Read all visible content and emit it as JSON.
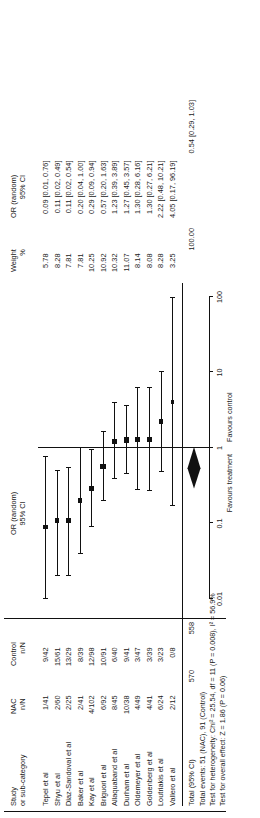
{
  "figure": {
    "type": "forest-plot",
    "columns": {
      "study_header_line1": "Study",
      "study_header_line2": "or sub-category",
      "nac_header_line1": "NAC",
      "nac_header_line2": "n/N",
      "control_header_line1": "Control",
      "control_header_line2": "n/N",
      "graph_header_line1": "OR (random)",
      "graph_header_line2": "95% CI",
      "weight_header_line1": "Weight",
      "weight_header_line2": "%",
      "or_header_line1": "OR (random)",
      "or_header_line2": "95% CI"
    },
    "axis": {
      "ticks": [
        "0.01",
        "0.1",
        "1",
        "10",
        "100"
      ],
      "left_label": "Favours treatment",
      "right_label": "Favours control"
    },
    "totals": {
      "label": "Total (95% CI)",
      "nac_total": "570",
      "control_total": "558",
      "weight": "100.00",
      "or_ci": "0.54 [0.29, 1.03]",
      "events_line": "Total events: 51 (NAC), 91 (Control)",
      "heterogeneity_line": "Test for heterogeneity: Chi² = 25.54, df = 11 (P = 0.008), I² = 56.9%",
      "overall_effect_line": "Test for overall effect: Z = 1.86 (P = 0.06)"
    }
  },
  "chart_data": {
    "type": "forest",
    "title": "",
    "xlabel": "",
    "ylabel": "",
    "xlim": [
      0.01,
      100
    ],
    "xscale": "log",
    "xticks": [
      0.01,
      0.1,
      1,
      10,
      100
    ],
    "grid": false,
    "legend": "none",
    "reference_line": 1,
    "annotations": [
      "Favours treatment",
      "Favours control"
    ],
    "studies": [
      {
        "name": "Tepel et al",
        "nac": "1/41",
        "control": "9/42",
        "weight": "5.78",
        "weight_value": 5.78,
        "or": 0.09,
        "ci_low": 0.01,
        "ci_high": 0.76,
        "or_ci": "0.09 [0.01, 0.76]"
      },
      {
        "name": "Shyu et al",
        "nac": "2/60",
        "control": "15/61",
        "weight": "8.28",
        "weight_value": 8.28,
        "or": 0.11,
        "ci_low": 0.02,
        "ci_high": 0.49,
        "or_ci": "0.11 [0.02, 0.49]"
      },
      {
        "name": "Diaz-Sandoval et al",
        "nac": "2/25",
        "control": "13/29",
        "weight": "7.81",
        "weight_value": 7.81,
        "or": 0.11,
        "ci_low": 0.02,
        "ci_high": 0.54,
        "or_ci": "0.11 [0.02, 0.54]"
      },
      {
        "name": "Baker et al",
        "nac": "2/41",
        "control": "8/39",
        "weight": "7.81",
        "weight_value": 7.81,
        "or": 0.2,
        "ci_low": 0.04,
        "ci_high": 1.0,
        "or_ci": "0.20 [0.04, 1.00]"
      },
      {
        "name": "Kay et al",
        "nac": "4/102",
        "control": "12/98",
        "weight": "10.25",
        "weight_value": 10.25,
        "or": 0.29,
        "ci_low": 0.09,
        "ci_high": 0.94,
        "or_ci": "0.29 [0.09, 0.94]"
      },
      {
        "name": "Briguori et al",
        "nac": "6/92",
        "control": "10/91",
        "weight": "10.92",
        "weight_value": 10.92,
        "or": 0.57,
        "ci_low": 0.2,
        "ci_high": 1.63,
        "or_ci": "0.57 [0.20, 1.63]"
      },
      {
        "name": "Allaquaband et al",
        "nac": "8/45",
        "control": "6/40",
        "weight": "10.32",
        "weight_value": 10.32,
        "or": 1.23,
        "ci_low": 0.39,
        "ci_high": 3.89,
        "or_ci": "1.23 [0.39, 3.89]"
      },
      {
        "name": "Durham et al",
        "nac": "10/38",
        "control": "9/41",
        "weight": "11.07",
        "weight_value": 11.07,
        "or": 1.27,
        "ci_low": 0.45,
        "ci_high": 3.57,
        "or_ci": "1.27 [0.45, 3.57]"
      },
      {
        "name": "Oldemeyer et al",
        "nac": "4/49",
        "control": "3/47",
        "weight": "8.14",
        "weight_value": 8.14,
        "or": 1.3,
        "ci_low": 0.28,
        "ci_high": 6.16,
        "or_ci": "1.30 [0.28, 6.16]"
      },
      {
        "name": "Goldenberg et al",
        "nac": "4/41",
        "control": "3/39",
        "weight": "8.08",
        "weight_value": 8.08,
        "or": 1.3,
        "ci_low": 0.27,
        "ci_high": 6.21,
        "or_ci": "1.30 [0.27, 6.21]"
      },
      {
        "name": "Loutriakis et al",
        "nac": "6/24",
        "control": "3/23",
        "weight": "8.28",
        "weight_value": 8.28,
        "or": 2.22,
        "ci_low": 0.48,
        "ci_high": 10.21,
        "or_ci": "2.22 [0.48, 10.21]"
      },
      {
        "name": "Vallero et al",
        "nac": "2/12",
        "control": "0/8",
        "weight": "3.25",
        "weight_value": 3.25,
        "or": 4.05,
        "ci_low": 0.17,
        "ci_high": 96.19,
        "or_ci": "4.05 [0.17, 96.19]"
      }
    ],
    "summary": {
      "label": "Total (95% CI)",
      "or": 0.54,
      "ci_low": 0.29,
      "ci_high": 1.03,
      "or_ci": "0.54 [0.29, 1.03]",
      "weight": "100.00"
    }
  }
}
